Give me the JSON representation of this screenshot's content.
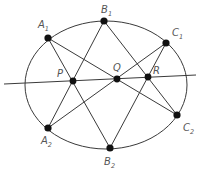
{
  "diagram": {
    "ellipse": {
      "cx": 106,
      "cy": 85,
      "rx": 81,
      "ry": 64
    },
    "points": [
      {
        "id": "A1",
        "base": "A",
        "sub": "1",
        "x": 48,
        "y": 38,
        "lx": 38,
        "ly": 28
      },
      {
        "id": "B1",
        "base": "B",
        "sub": "1",
        "x": 104,
        "y": 21,
        "lx": 101,
        "ly": 13
      },
      {
        "id": "C1",
        "base": "C",
        "sub": "1",
        "x": 166,
        "y": 43,
        "lx": 172,
        "ly": 36
      },
      {
        "id": "C2",
        "base": "C",
        "sub": "2",
        "x": 177,
        "y": 115,
        "lx": 183,
        "ly": 131
      },
      {
        "id": "B2",
        "base": "B",
        "sub": "2",
        "x": 110,
        "y": 148,
        "lx": 104,
        "ly": 165
      },
      {
        "id": "A2",
        "base": "A",
        "sub": "2",
        "x": 48,
        "y": 128,
        "lx": 41,
        "ly": 144
      }
    ],
    "intersections": [
      {
        "id": "P",
        "x": 73,
        "y": 81,
        "lx": 57,
        "ly": 77
      },
      {
        "id": "Q",
        "x": 117,
        "y": 79,
        "lx": 113,
        "ly": 71
      },
      {
        "id": "R",
        "x": 148,
        "y": 77,
        "lx": 153,
        "ly": 74
      }
    ],
    "segments": [
      [
        "A1",
        "B2"
      ],
      [
        "A1",
        "C2"
      ],
      [
        "B1",
        "A2"
      ],
      [
        "B1",
        "C2"
      ],
      [
        "C1",
        "A2"
      ],
      [
        "C1",
        "B2"
      ]
    ],
    "pascal_line": {
      "x1": 4,
      "y1": 84,
      "x2": 196,
      "y2": 75
    },
    "colors": {
      "stroke": "#3a3a3a",
      "dot": "#111111",
      "label": "#555555",
      "background": "#ffffff"
    }
  }
}
